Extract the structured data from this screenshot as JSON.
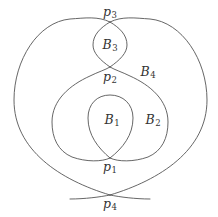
{
  "diagram": {
    "stroke_color": "#555555",
    "background": "#ffffff",
    "points": [
      {
        "id": "p1",
        "base": "p",
        "sub": "1",
        "x": 110,
        "y": 168
      },
      {
        "id": "p2",
        "base": "p",
        "sub": "2",
        "x": 110,
        "y": 78
      },
      {
        "id": "p3",
        "base": "p",
        "sub": "3",
        "x": 110,
        "y": 13
      },
      {
        "id": "p4",
        "base": "p",
        "sub": "4",
        "x": 110,
        "y": 205
      }
    ],
    "regions": [
      {
        "id": "B1",
        "base": "B",
        "sub": "1",
        "x": 112,
        "y": 121
      },
      {
        "id": "B2",
        "base": "B",
        "sub": "2",
        "x": 153,
        "y": 121
      },
      {
        "id": "B3",
        "base": "B",
        "sub": "3",
        "x": 110,
        "y": 46
      },
      {
        "id": "B4",
        "base": "B",
        "sub": "4",
        "x": 148,
        "y": 73
      }
    ]
  }
}
